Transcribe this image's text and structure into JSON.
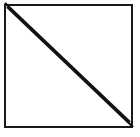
{
  "figure": {
    "canvas": {
      "width": 140,
      "height": 137,
      "background_color": "#ffffff"
    },
    "shapes": {
      "square_outline": {
        "name": "Square outline",
        "x": 5,
        "y": 5,
        "width": 127,
        "height": 122,
        "stroke_color": "#1a1a1a",
        "stroke_width": 2,
        "fill_color": "#ffffff"
      },
      "diagonal_upper": {
        "name": "Upper diagonal line",
        "x1": 5,
        "y1": 3,
        "x2": 130,
        "y2": 122,
        "stroke_color": "#111111",
        "stroke_width": 2.2
      },
      "diagonal_lower": {
        "name": "Lower diagonal line",
        "x1": 7,
        "y1": 7,
        "x2": 133,
        "y2": 127,
        "stroke_color": "#111111",
        "stroke_width": 2.2
      }
    },
    "regions": {
      "upper_right_triangle_fill": "#ffffff",
      "lower_left_triangle_fill": "#ffffff"
    }
  }
}
